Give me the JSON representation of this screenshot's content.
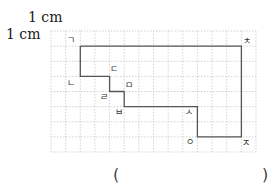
{
  "scale": {
    "horizontal_label": "1 cm",
    "vertical_label": "1 cm"
  },
  "grid": {
    "columns": 14,
    "rows": 8,
    "line_color": "#c8c8c8",
    "shape_color": "#555555"
  },
  "vertices": [
    {
      "name": "ㄱ",
      "col": 2,
      "row": 1
    },
    {
      "name": "ㄴ",
      "col": 2,
      "row": 3
    },
    {
      "name": "ㄷ",
      "col": 4,
      "row": 3
    },
    {
      "name": "ㄹ",
      "col": 4,
      "row": 4
    },
    {
      "name": "ㅁ",
      "col": 5,
      "row": 4
    },
    {
      "name": "ㅂ",
      "col": 5,
      "row": 5
    },
    {
      "name": "ㅅ",
      "col": 10,
      "row": 5
    },
    {
      "name": "ㅇ",
      "col": 10,
      "row": 7
    },
    {
      "name": "ㅈ",
      "col": 13,
      "row": 7
    },
    {
      "name": "ㅊ",
      "col": 13,
      "row": 1
    }
  ],
  "labels": {
    "g": "ㄱ",
    "n": "ㄴ",
    "d": "ㄷ",
    "r": "ㄹ",
    "m": "ㅁ",
    "b": "ㅂ",
    "s": "ㅅ",
    "o": "ㅇ",
    "j": "ㅈ",
    "ch": "ㅊ"
  },
  "answer": {
    "open_paren": "(",
    "close_paren": ")",
    "value": ""
  }
}
